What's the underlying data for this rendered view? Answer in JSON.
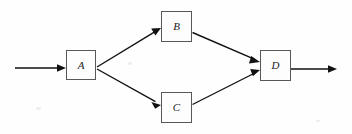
{
  "figure": {
    "title": "",
    "background_color": "#fefefe",
    "line_color": "#111111",
    "box_border_color": "#575757",
    "label_color": "#1a1a1a",
    "width": 352,
    "height": 134
  },
  "nodes": [
    {
      "id": "A",
      "label": "A",
      "x": 66,
      "y": 50,
      "w": 30,
      "h": 30
    },
    {
      "id": "B",
      "label": "B",
      "x": 161,
      "y": 11,
      "w": 31,
      "h": 31
    },
    {
      "id": "C",
      "label": "C",
      "x": 161,
      "y": 92,
      "w": 31,
      "h": 31
    },
    {
      "id": "D",
      "label": "D",
      "x": 260,
      "y": 50,
      "w": 31,
      "h": 31
    }
  ],
  "edges": [
    {
      "id": "in-to-a",
      "from": "",
      "to": "A",
      "from_point": [
        15,
        68
      ],
      "to_point": [
        66,
        68
      ],
      "arrowhead": true
    },
    {
      "id": "a-to-b",
      "from": "A",
      "to": "B",
      "from_point": [
        96,
        68
      ],
      "to_point": [
        160,
        28
      ],
      "arrowhead": true
    },
    {
      "id": "a-to-c",
      "from": "A",
      "to": "C",
      "from_point": [
        96,
        68
      ],
      "to_point": [
        160,
        105
      ],
      "arrowhead": true
    },
    {
      "id": "b-to-d",
      "from": "B",
      "to": "D",
      "from_point": [
        192,
        32
      ],
      "to_point": [
        259,
        62
      ],
      "arrowhead": true
    },
    {
      "id": "c-to-d",
      "from": "C",
      "to": "D",
      "from_point": [
        192,
        105
      ],
      "to_point": [
        259,
        70
      ],
      "arrowhead": true
    },
    {
      "id": "d-to-out",
      "from": "D",
      "to": "",
      "from_point": [
        291,
        69
      ],
      "to_point": [
        337,
        69
      ],
      "arrowhead": true
    }
  ]
}
